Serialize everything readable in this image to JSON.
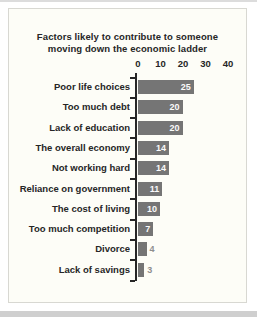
{
  "page": {
    "background": "#ffffff",
    "top_edge_color": "#dcdcdc",
    "bottom_edge_color": "#cfcfcf"
  },
  "panel": {
    "background": "#fdfdf7",
    "border_color": "#d8d8d2"
  },
  "chart_data": {
    "type": "bar",
    "orientation": "horizontal",
    "title": "Factors likely to contribute to someone moving down the economic ladder",
    "title_lines": {
      "line1": "Factors likely to contribute to someone",
      "line2": "moving down the economic ladder"
    },
    "categories": [
      "Poor life choices",
      "Too much debt",
      "Lack of education",
      "The overall economy",
      "Not working hard",
      "Reliance on government",
      "The cost of living",
      "Too much competition",
      "Divorce",
      "Lack of savings"
    ],
    "values": [
      25,
      20,
      20,
      14,
      14,
      11,
      10,
      7,
      4,
      3
    ],
    "x_ticks": [
      0,
      10,
      20,
      30,
      40
    ],
    "xlim": [
      0,
      40
    ],
    "grid": false,
    "legend": "none",
    "bar_color": "#757575",
    "value_label_color_inside": "#fafafa",
    "value_label_color_outside": "#8e8e8e",
    "axis_color": "#262626",
    "text_color": "#262626"
  }
}
